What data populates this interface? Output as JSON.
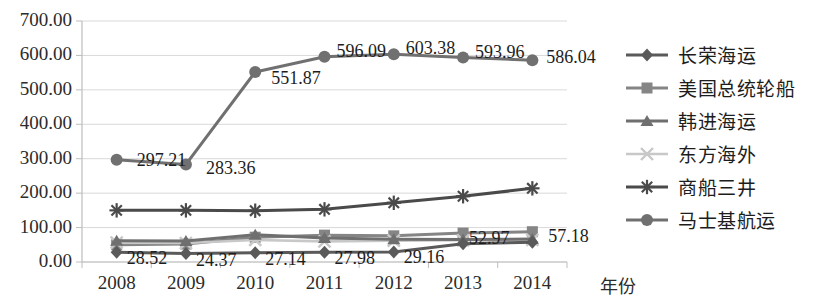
{
  "chart_data": {
    "type": "line",
    "title": "",
    "xlabel": "年份",
    "ylabel": "",
    "categories": [
      "2008",
      "2009",
      "2010",
      "2011",
      "2012",
      "2013",
      "2014"
    ],
    "ylim": [
      0,
      700
    ],
    "ytick_labels": [
      "0.00",
      "100.00",
      "200.00",
      "300.00",
      "400.00",
      "500.00",
      "600.00",
      "700.00"
    ],
    "yticks": [
      0,
      100,
      200,
      300,
      400,
      500,
      600,
      700
    ],
    "grid": true,
    "legend_position": "right",
    "series": [
      {
        "name": "长荣海运",
        "marker": "diamond",
        "color": "#5a5a5a",
        "values": [
          28.52,
          24.37,
          27.14,
          27.98,
          29.16,
          52.97,
          57.18
        ],
        "labels": [
          "28.52",
          "24.37",
          "27.14",
          "27.98",
          "29.16",
          "52.97",
          "57.18"
        ]
      },
      {
        "name": "美国总统轮船",
        "marker": "square",
        "color": "#858585",
        "values": [
          50.0,
          52.0,
          72.0,
          78.0,
          76.0,
          84.0,
          88.0
        ],
        "labels": []
      },
      {
        "name": "韩进海运",
        "marker": "triangle",
        "color": "#6f6f6f",
        "values": [
          62.0,
          61.0,
          79.0,
          70.0,
          66.0,
          65.0,
          67.0
        ],
        "labels": []
      },
      {
        "name": "东方海外",
        "marker": "cross",
        "color": "#c8c8c8",
        "values": [
          56.0,
          55.0,
          64.0,
          60.0,
          62.0,
          63.0,
          64.0
        ],
        "labels": []
      },
      {
        "name": "商船三井",
        "marker": "asterisk",
        "color": "#4a4a4a",
        "values": [
          150.0,
          150.0,
          149.0,
          153.0,
          172.0,
          191.0,
          214.0
        ],
        "labels": []
      },
      {
        "name": "马士基航运",
        "marker": "circle",
        "color": "#707070",
        "values": [
          297.21,
          283.36,
          551.87,
          596.09,
          603.38,
          593.96,
          586.04
        ],
        "labels": [
          "297.21",
          "283.36",
          "551.87",
          "596.09",
          "603.38",
          "593.96",
          "586.04"
        ]
      }
    ]
  },
  "axis": {
    "x_title": "年份"
  },
  "legend": {
    "items": [
      {
        "label": "长荣海运"
      },
      {
        "label": "美国总统轮船"
      },
      {
        "label": "韩进海运"
      },
      {
        "label": "东方海外"
      },
      {
        "label": "商船三井"
      },
      {
        "label": "马士基航运"
      }
    ]
  },
  "ytick_labels": [
    "700.00",
    "600.00",
    "500.00",
    "400.00",
    "300.00",
    "200.00",
    "100.00",
    "0.00"
  ],
  "xtick_labels": [
    "2008",
    "2009",
    "2010",
    "2011",
    "2012",
    "2013",
    "2014"
  ],
  "data_labels": {
    "maersk": [
      "297.21",
      "283.36",
      "551.87",
      "596.09",
      "603.38",
      "593.96",
      "586.04"
    ],
    "evergreen": [
      "28.52",
      "24.37",
      "27.14",
      "27.98",
      "29.16",
      "52.97",
      "57.18"
    ]
  }
}
